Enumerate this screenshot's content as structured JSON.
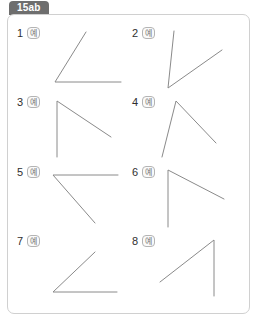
{
  "tab": {
    "label": "15ab",
    "name": "tab-15ab"
  },
  "panel": {
    "name": "worksheet-panel"
  },
  "badge": {
    "label": "예"
  },
  "colors": {
    "tab_background": "#6e6e6e",
    "tab_text": "#ffffff",
    "panel_border": "#d0d0d0",
    "panel_background": "#ffffff",
    "stroke": "#8a8a8a",
    "number_text": "#2f2f2f",
    "badge_border": "#b4b4b4",
    "badge_text": "#777777"
  },
  "problems": [
    {
      "number": "1",
      "badge": "예",
      "description": "acute angle opening up-right, vertex at lower-left, horizontal ray right and diagonal ray up-right",
      "vertex": [
        42,
        56
      ],
      "rays": [
        [
          108,
          56
        ],
        [
          73,
          6
        ]
      ]
    },
    {
      "number": "2",
      "badge": "예",
      "description": "acute angle, vertex at bottom, vertical ray up and diagonal ray up-right",
      "vertex": [
        40,
        62
      ],
      "rays": [
        [
          46,
          5
        ],
        [
          94,
          24
        ]
      ]
    },
    {
      "number": "3",
      "badge": "예",
      "description": "right-like angle, vertex at top-left, vertical ray down and diagonal ray down-right",
      "vertex": [
        44,
        6
      ],
      "rays": [
        [
          44,
          62
        ],
        [
          98,
          42
        ]
      ]
    },
    {
      "number": "4",
      "badge": "예",
      "description": "inverted V, vertex at top, two rays spreading down-left and down-right",
      "vertex": [
        48,
        6
      ],
      "rays": [
        [
          34,
          62
        ],
        [
          88,
          48
        ]
      ]
    },
    {
      "number": "5",
      "badge": "예",
      "description": "angle with vertex at upper-left, horizontal ray right and diagonal ray down-right",
      "vertex": [
        40,
        10
      ],
      "rays": [
        [
          105,
          10
        ],
        [
          82,
          58
        ]
      ]
    },
    {
      "number": "6",
      "badge": "예",
      "description": "angle with vertex at top-left, vertical ray down and diagonal ray down-right",
      "vertex": [
        40,
        5
      ],
      "rays": [
        [
          40,
          62
        ],
        [
          96,
          34
        ]
      ]
    },
    {
      "number": "7",
      "badge": "예",
      "description": "acute angle opening up-right, vertex at lower-left, horizontal ray right and diagonal ray up-right",
      "vertex": [
        40,
        58
      ],
      "rays": [
        [
          104,
          58
        ],
        [
          82,
          18
        ]
      ]
    },
    {
      "number": "8",
      "badge": "예",
      "description": "angle with vertex at top-right, vertical ray down and diagonal ray down-left",
      "vertex": [
        86,
        6
      ],
      "rays": [
        [
          86,
          62
        ],
        [
          32,
          48
        ]
      ]
    }
  ]
}
